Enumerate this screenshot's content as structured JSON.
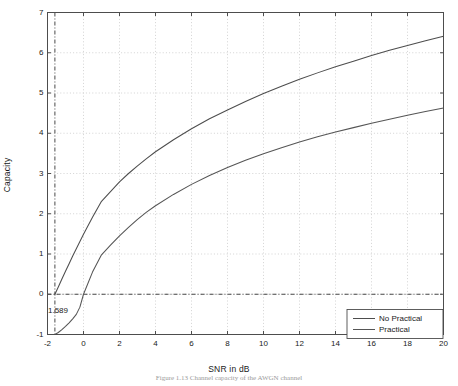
{
  "chart_data": {
    "type": "line",
    "title": "",
    "xlabel": "SNR in dB",
    "ylabel": "Capacity",
    "xlim": [
      -2,
      20
    ],
    "ylim": [
      -1,
      7
    ],
    "xticks": [
      "-2",
      "0",
      "2",
      "4",
      "6",
      "8",
      "10",
      "12",
      "14",
      "16",
      "18",
      "20"
    ],
    "xtick_values": [
      -2,
      0,
      2,
      4,
      6,
      8,
      10,
      12,
      14,
      16,
      18,
      20
    ],
    "yticks": [
      "-1",
      "0",
      "1",
      "2",
      "3",
      "4",
      "5",
      "6",
      "7"
    ],
    "ytick_values": [
      -1,
      0,
      1,
      2,
      3,
      4,
      5,
      6,
      7
    ],
    "grid": true,
    "grid_style": "dotted",
    "legend_position": "lower right",
    "annotations": [
      {
        "text": "1.589",
        "x": -1.589,
        "y": 0
      }
    ],
    "reference_lines": [
      {
        "orientation": "vertical",
        "value": -1.589,
        "style": "dash-dot"
      },
      {
        "orientation": "horizontal",
        "value": 0,
        "style": "dash-dot"
      }
    ],
    "x": [
      -1.589,
      -1.4,
      -1.2,
      -1.0,
      -0.8,
      -0.6,
      -0.4,
      -0.2,
      0.0,
      0.5,
      1.0,
      1.5,
      2.0,
      2.5,
      3.0,
      3.5,
      4.0,
      5.0,
      6.0,
      7.0,
      8.0,
      9.0,
      10.0,
      11.0,
      12.0,
      13.0,
      14.0,
      15.0,
      16.0,
      17.0,
      18.0,
      19.0,
      20.0
    ],
    "series": [
      {
        "name": "No Practical",
        "color": "#4d4d4d",
        "values": [
          0.0,
          0.18,
          0.38,
          0.57,
          0.76,
          0.95,
          1.13,
          1.31,
          1.49,
          1.91,
          2.31,
          2.55,
          2.79,
          3.0,
          3.19,
          3.37,
          3.54,
          3.84,
          4.11,
          4.36,
          4.58,
          4.79,
          4.99,
          5.17,
          5.34,
          5.5,
          5.65,
          5.79,
          5.93,
          6.06,
          6.18,
          6.3,
          6.41
        ]
      },
      {
        "name": "Practical",
        "color": "#555555",
        "values": [
          -1.0,
          -0.95,
          -0.88,
          -0.8,
          -0.71,
          -0.61,
          -0.5,
          -0.32,
          0.0,
          0.55,
          0.98,
          1.22,
          1.45,
          1.66,
          1.86,
          2.04,
          2.2,
          2.48,
          2.73,
          2.95,
          3.15,
          3.33,
          3.49,
          3.64,
          3.78,
          3.91,
          4.03,
          4.14,
          4.25,
          4.35,
          4.45,
          4.54,
          4.63
        ]
      }
    ]
  },
  "caption": {
    "text": "Figure  1.13   Channel capacity of the AWGN channel"
  },
  "legend": {
    "entries": [
      {
        "label": "No Practical"
      },
      {
        "label": "Practical"
      }
    ]
  },
  "colors": {
    "axis": "#4d4d4d",
    "grid": "#c8c8c8",
    "curve": "#4d4d4d",
    "text": "#1a1a1a",
    "background": "#ffffff"
  }
}
